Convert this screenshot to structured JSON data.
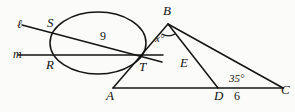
{
  "figure": {
    "type": "geometry-diagram"
  },
  "points": {
    "B": {
      "label": "B",
      "x": 168,
      "y": 22
    },
    "S": {
      "label": "S",
      "x": 52,
      "y": 28
    },
    "R": {
      "label": "R",
      "x": 52,
      "y": 55
    },
    "T": {
      "label": "T",
      "x": 138,
      "y": 58
    },
    "E": {
      "label": "E",
      "x": 186,
      "y": 62
    },
    "A": {
      "label": "A",
      "x": 113,
      "y": 88
    },
    "D": {
      "label": "D",
      "x": 218,
      "y": 88
    },
    "C": {
      "label": "C",
      "x": 283,
      "y": 88
    }
  },
  "lines": {
    "l": {
      "label": "ℓ"
    },
    "m": {
      "label": "m"
    }
  },
  "measures": {
    "chord_ST": "9",
    "segment_DC": "6",
    "angle_C": "35°",
    "angle_B": "x°"
  }
}
